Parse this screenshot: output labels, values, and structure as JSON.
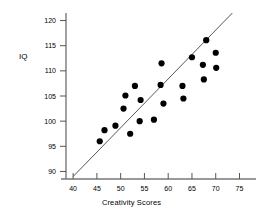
{
  "chart_data": {
    "type": "scatter",
    "title": "",
    "xlabel": "Creativity Scores",
    "ylabel": "IQ",
    "xlim": [
      38.5,
      77
    ],
    "ylim": [
      88.5,
      121.5
    ],
    "xticks": [
      40,
      45,
      50,
      55,
      60,
      65,
      70,
      75
    ],
    "yticks": [
      90,
      95,
      100,
      105,
      110,
      115,
      120
    ],
    "grid": false,
    "legend": null,
    "marker": {
      "shape": "circle",
      "color": "#000000",
      "size": 3.1
    },
    "points": [
      {
        "x": 45.6,
        "y": 96.0
      },
      {
        "x": 46.6,
        "y": 98.2
      },
      {
        "x": 48.9,
        "y": 99.1
      },
      {
        "x": 50.6,
        "y": 102.5
      },
      {
        "x": 51.0,
        "y": 105.1
      },
      {
        "x": 52.0,
        "y": 97.5
      },
      {
        "x": 53.0,
        "y": 107.0
      },
      {
        "x": 54.0,
        "y": 100.0
      },
      {
        "x": 54.2,
        "y": 104.2
      },
      {
        "x": 57.0,
        "y": 100.3
      },
      {
        "x": 58.4,
        "y": 107.2
      },
      {
        "x": 58.6,
        "y": 111.5
      },
      {
        "x": 59.0,
        "y": 103.5
      },
      {
        "x": 63.0,
        "y": 107.0
      },
      {
        "x": 63.2,
        "y": 104.5
      },
      {
        "x": 65.0,
        "y": 112.7
      },
      {
        "x": 67.3,
        "y": 111.2
      },
      {
        "x": 67.5,
        "y": 108.3
      },
      {
        "x": 68.0,
        "y": 116.1
      },
      {
        "x": 70.0,
        "y": 113.6
      },
      {
        "x": 70.1,
        "y": 110.6
      }
    ],
    "trendline": {
      "type": "line",
      "color": "#444444",
      "x_start": 40.0,
      "y_start": 89.0,
      "x_end": 73.5,
      "y_end": 121.5
    }
  },
  "axes": {
    "y_tick_labels": [
      "120",
      "115",
      "110",
      "105",
      "100",
      "95",
      "90"
    ],
    "x_tick_labels": [
      "40",
      "45",
      "50",
      "55",
      "60",
      "65",
      "70",
      "75"
    ]
  }
}
